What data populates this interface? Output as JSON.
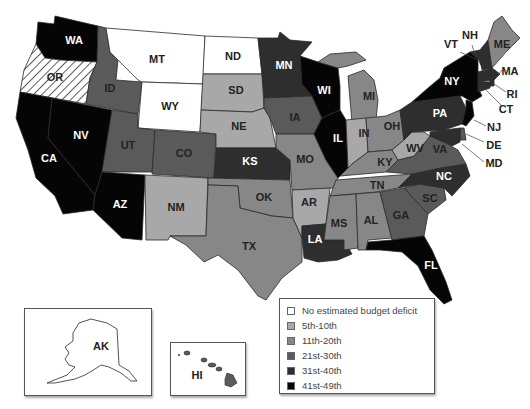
{
  "legend": {
    "items": [
      {
        "label": "No estimated budget deficit",
        "color": "#ffffff"
      },
      {
        "label": "5th-10th",
        "color": "#a8a8a8"
      },
      {
        "label": "11th-20th",
        "color": "#878787"
      },
      {
        "label": "21st-30th",
        "color": "#5a5a5a"
      },
      {
        "label": "31st-40th",
        "color": "#2e2e2e"
      },
      {
        "label": "41st-49th",
        "color": "#050505"
      }
    ]
  },
  "states": [
    {
      "abbr": "WA",
      "category": "41st-49th"
    },
    {
      "abbr": "OR",
      "category": "hatched"
    },
    {
      "abbr": "CA",
      "category": "41st-49th"
    },
    {
      "abbr": "NV",
      "category": "41st-49th"
    },
    {
      "abbr": "ID",
      "category": "21st-30th"
    },
    {
      "abbr": "MT",
      "category": "No estimated budget deficit"
    },
    {
      "abbr": "WY",
      "category": "No estimated budget deficit"
    },
    {
      "abbr": "UT",
      "category": "21st-30th"
    },
    {
      "abbr": "AZ",
      "category": "41st-49th"
    },
    {
      "abbr": "CO",
      "category": "21st-30th"
    },
    {
      "abbr": "NM",
      "category": "5th-10th"
    },
    {
      "abbr": "ND",
      "category": "No estimated budget deficit"
    },
    {
      "abbr": "SD",
      "category": "5th-10th"
    },
    {
      "abbr": "NE",
      "category": "5th-10th"
    },
    {
      "abbr": "KS",
      "category": "31st-40th"
    },
    {
      "abbr": "OK",
      "category": "11th-20th"
    },
    {
      "abbr": "TX",
      "category": "11th-20th"
    },
    {
      "abbr": "MN",
      "category": "31st-40th"
    },
    {
      "abbr": "IA",
      "category": "21st-30th"
    },
    {
      "abbr": "MO",
      "category": "11th-20th"
    },
    {
      "abbr": "AR",
      "category": "5th-10th"
    },
    {
      "abbr": "LA",
      "category": "31st-40th"
    },
    {
      "abbr": "WI",
      "category": "41st-49th"
    },
    {
      "abbr": "IL",
      "category": "41st-49th"
    },
    {
      "abbr": "MI",
      "category": "11th-20th"
    },
    {
      "abbr": "IN",
      "category": "5th-10th"
    },
    {
      "abbr": "OH",
      "category": "11th-20th"
    },
    {
      "abbr": "KY",
      "category": "11th-20th"
    },
    {
      "abbr": "TN",
      "category": "11th-20th"
    },
    {
      "abbr": "MS",
      "category": "11th-20th"
    },
    {
      "abbr": "AL",
      "category": "11th-20th"
    },
    {
      "abbr": "GA",
      "category": "21st-30th"
    },
    {
      "abbr": "FL",
      "category": "41st-49th"
    },
    {
      "abbr": "SC",
      "category": "21st-30th"
    },
    {
      "abbr": "NC",
      "category": "31st-40th"
    },
    {
      "abbr": "VA",
      "category": "21st-30th"
    },
    {
      "abbr": "WV",
      "category": "5th-10th"
    },
    {
      "abbr": "PA",
      "category": "31st-40th"
    },
    {
      "abbr": "NY",
      "category": "41st-49th"
    },
    {
      "abbr": "VT",
      "category": "31st-40th"
    },
    {
      "abbr": "NH",
      "category": "31st-40th"
    },
    {
      "abbr": "ME",
      "category": "11th-20th"
    },
    {
      "abbr": "MA",
      "category": "31st-40th"
    },
    {
      "abbr": "RI",
      "category": "31st-40th"
    },
    {
      "abbr": "CT",
      "category": "31st-40th"
    },
    {
      "abbr": "NJ",
      "category": "41st-49th"
    },
    {
      "abbr": "DE",
      "category": "21st-30th"
    },
    {
      "abbr": "MD",
      "category": "31st-40th"
    },
    {
      "abbr": "AK",
      "category": "No estimated budget deficit"
    },
    {
      "abbr": "HI",
      "category": "21st-30th"
    }
  ],
  "labels": {
    "WA": "WA",
    "OR": "OR",
    "CA": "CA",
    "NV": "NV",
    "ID": "ID",
    "MT": "MT",
    "WY": "WY",
    "UT": "UT",
    "AZ": "AZ",
    "CO": "CO",
    "NM": "NM",
    "ND": "ND",
    "SD": "SD",
    "NE": "NE",
    "KS": "KS",
    "OK": "OK",
    "TX": "TX",
    "MN": "MN",
    "IA": "IA",
    "MO": "MO",
    "AR": "AR",
    "LA": "LA",
    "WI": "WI",
    "IL": "IL",
    "MI": "MI",
    "IN": "IN",
    "OH": "OH",
    "KY": "KY",
    "TN": "TN",
    "MS": "MS",
    "AL": "AL",
    "GA": "GA",
    "FL": "FL",
    "SC": "SC",
    "NC": "NC",
    "VA": "VA",
    "WV": "WV",
    "PA": "PA",
    "NY": "NY",
    "VT": "VT",
    "NH": "NH",
    "ME": "ME",
    "MA": "MA",
    "RI": "RI",
    "CT": "CT",
    "NJ": "NJ",
    "DE": "DE",
    "MD": "MD",
    "AK": "AK",
    "HI": "HI"
  }
}
